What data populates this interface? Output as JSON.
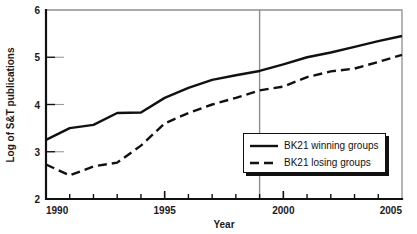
{
  "chart_data": {
    "type": "line",
    "title": "",
    "xlabel": "Year",
    "ylabel": "Log of S&T publications",
    "xlim": [
      1990,
      2005
    ],
    "ylim": [
      2,
      6
    ],
    "xticks": [
      1990,
      1995,
      2000,
      2005
    ],
    "xtick_labels": [
      "1990",
      "1995",
      "2000",
      "2005"
    ],
    "xminor_ticks": [
      1991,
      1992,
      1993,
      1994,
      1996,
      1997,
      1998,
      1999,
      2001,
      2002,
      2003,
      2004
    ],
    "yticks": [
      2,
      3,
      4,
      5,
      6
    ],
    "ytick_labels": [
      "2",
      "3",
      "4",
      "5",
      "6"
    ],
    "grid": false,
    "legend_position": "lower-right",
    "annotations": [
      {
        "type": "vline",
        "x": 1999,
        "color": "#8e8e8e",
        "label": ""
      }
    ],
    "x": [
      1990,
      1991,
      1992,
      1993,
      1994,
      1995,
      1996,
      1997,
      1998,
      1999,
      2000,
      2001,
      2002,
      2003,
      2004,
      2005
    ],
    "series": [
      {
        "name": "BK21 winning groups",
        "style": "solid",
        "color": "#111111",
        "values": [
          3.25,
          3.5,
          3.57,
          3.82,
          3.83,
          4.14,
          4.35,
          4.52,
          4.62,
          4.71,
          4.85,
          5.0,
          5.1,
          5.22,
          5.34,
          5.45
        ]
      },
      {
        "name": "BK21 losing groups",
        "style": "dashed",
        "color": "#111111",
        "values": [
          2.73,
          2.5,
          2.69,
          2.77,
          3.13,
          3.6,
          3.82,
          4.0,
          4.14,
          4.3,
          4.38,
          4.58,
          4.7,
          4.76,
          4.9,
          5.05
        ]
      }
    ]
  },
  "legend": {
    "items": [
      {
        "label": "BK21 winning groups",
        "style": "solid"
      },
      {
        "label": "BK21 losing groups",
        "style": "dashed"
      }
    ]
  },
  "axes": {
    "x_title": "Year",
    "y_title": "Log of S&T publications"
  }
}
